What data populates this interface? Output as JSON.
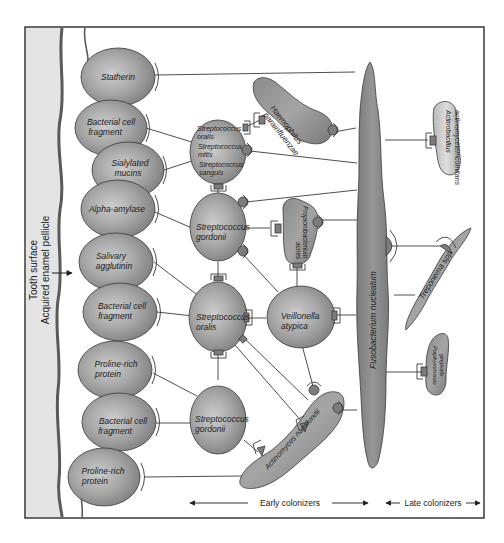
{
  "figure": {
    "side_labels": {
      "tooth_surface": "Tooth surface",
      "pellicle": "Acquired enamel pellicle"
    },
    "pellicle_receptors": [
      {
        "id": "statherin",
        "label_lines": [
          "Statherin"
        ]
      },
      {
        "id": "bcf1",
        "label_lines": [
          "Bacterial cell",
          "fragment"
        ]
      },
      {
        "id": "sialylated",
        "label_lines": [
          "Sialylated",
          "mucins"
        ]
      },
      {
        "id": "alpha",
        "label_lines": [
          "Alpha-amylase"
        ]
      },
      {
        "id": "agglutinin",
        "label_lines": [
          "Salivary",
          "agglutinin"
        ]
      },
      {
        "id": "bcf2",
        "label_lines": [
          "Bacterial cell",
          "fragment"
        ]
      },
      {
        "id": "prp1",
        "label_lines": [
          "Proline-rich",
          "protein"
        ]
      },
      {
        "id": "bcf3",
        "label_lines": [
          "Bacterial cell",
          "fragment"
        ]
      },
      {
        "id": "prp2",
        "label_lines": [
          "Proline-rich",
          "protein"
        ]
      }
    ],
    "early_colonizers": [
      {
        "id": "s_oms",
        "label_lines": [
          "Streptococcus",
          "oralis",
          "Streptococcus",
          "mitis",
          "Streptococcus",
          "sanguis"
        ]
      },
      {
        "id": "s_gordonii_1",
        "label_lines": [
          "Streptococcus",
          "gordonii"
        ]
      },
      {
        "id": "s_oralis",
        "label_lines": [
          "Streptococcus",
          "oralis"
        ]
      },
      {
        "id": "s_gordonii_2",
        "label_lines": [
          "Streptococcus",
          "gordonii"
        ]
      },
      {
        "id": "veillonella",
        "label_lines": [
          "Veillonella",
          "atypica"
        ]
      },
      {
        "id": "haemophilus",
        "label_lines": [
          "Haemophilus",
          "parainfluenzae"
        ]
      },
      {
        "id": "propionibacterium",
        "label_lines": [
          "Propionibacterium",
          "acnes"
        ]
      },
      {
        "id": "actinomyces",
        "label_lines": [
          "Actinomyces naeslundii"
        ]
      }
    ],
    "bridge": {
      "id": "fusobacterium",
      "label": "Fusobacterium nucleatum"
    },
    "late_colonizers": [
      {
        "id": "actinobacillus",
        "label_lines": [
          "Actinobacillus",
          "actinomycetemcomitans"
        ]
      },
      {
        "id": "treponema",
        "label_lines": [
          "Treponema spp."
        ]
      },
      {
        "id": "porphyromonas",
        "label_lines": [
          "Porphyromonas",
          "gingivalis"
        ]
      }
    ],
    "axis_labels": {
      "early": "Early colonizers",
      "late": "Late colonizers"
    },
    "colors": {
      "cell_fill": "#9a9a9a",
      "cell_highlight": "#cfcfcf",
      "tooth_fill": "#e4e4e4",
      "enamel_edge": "#6f6f6f",
      "stroke": "#3a3a3a",
      "frame": "#2a2a2a"
    }
  }
}
